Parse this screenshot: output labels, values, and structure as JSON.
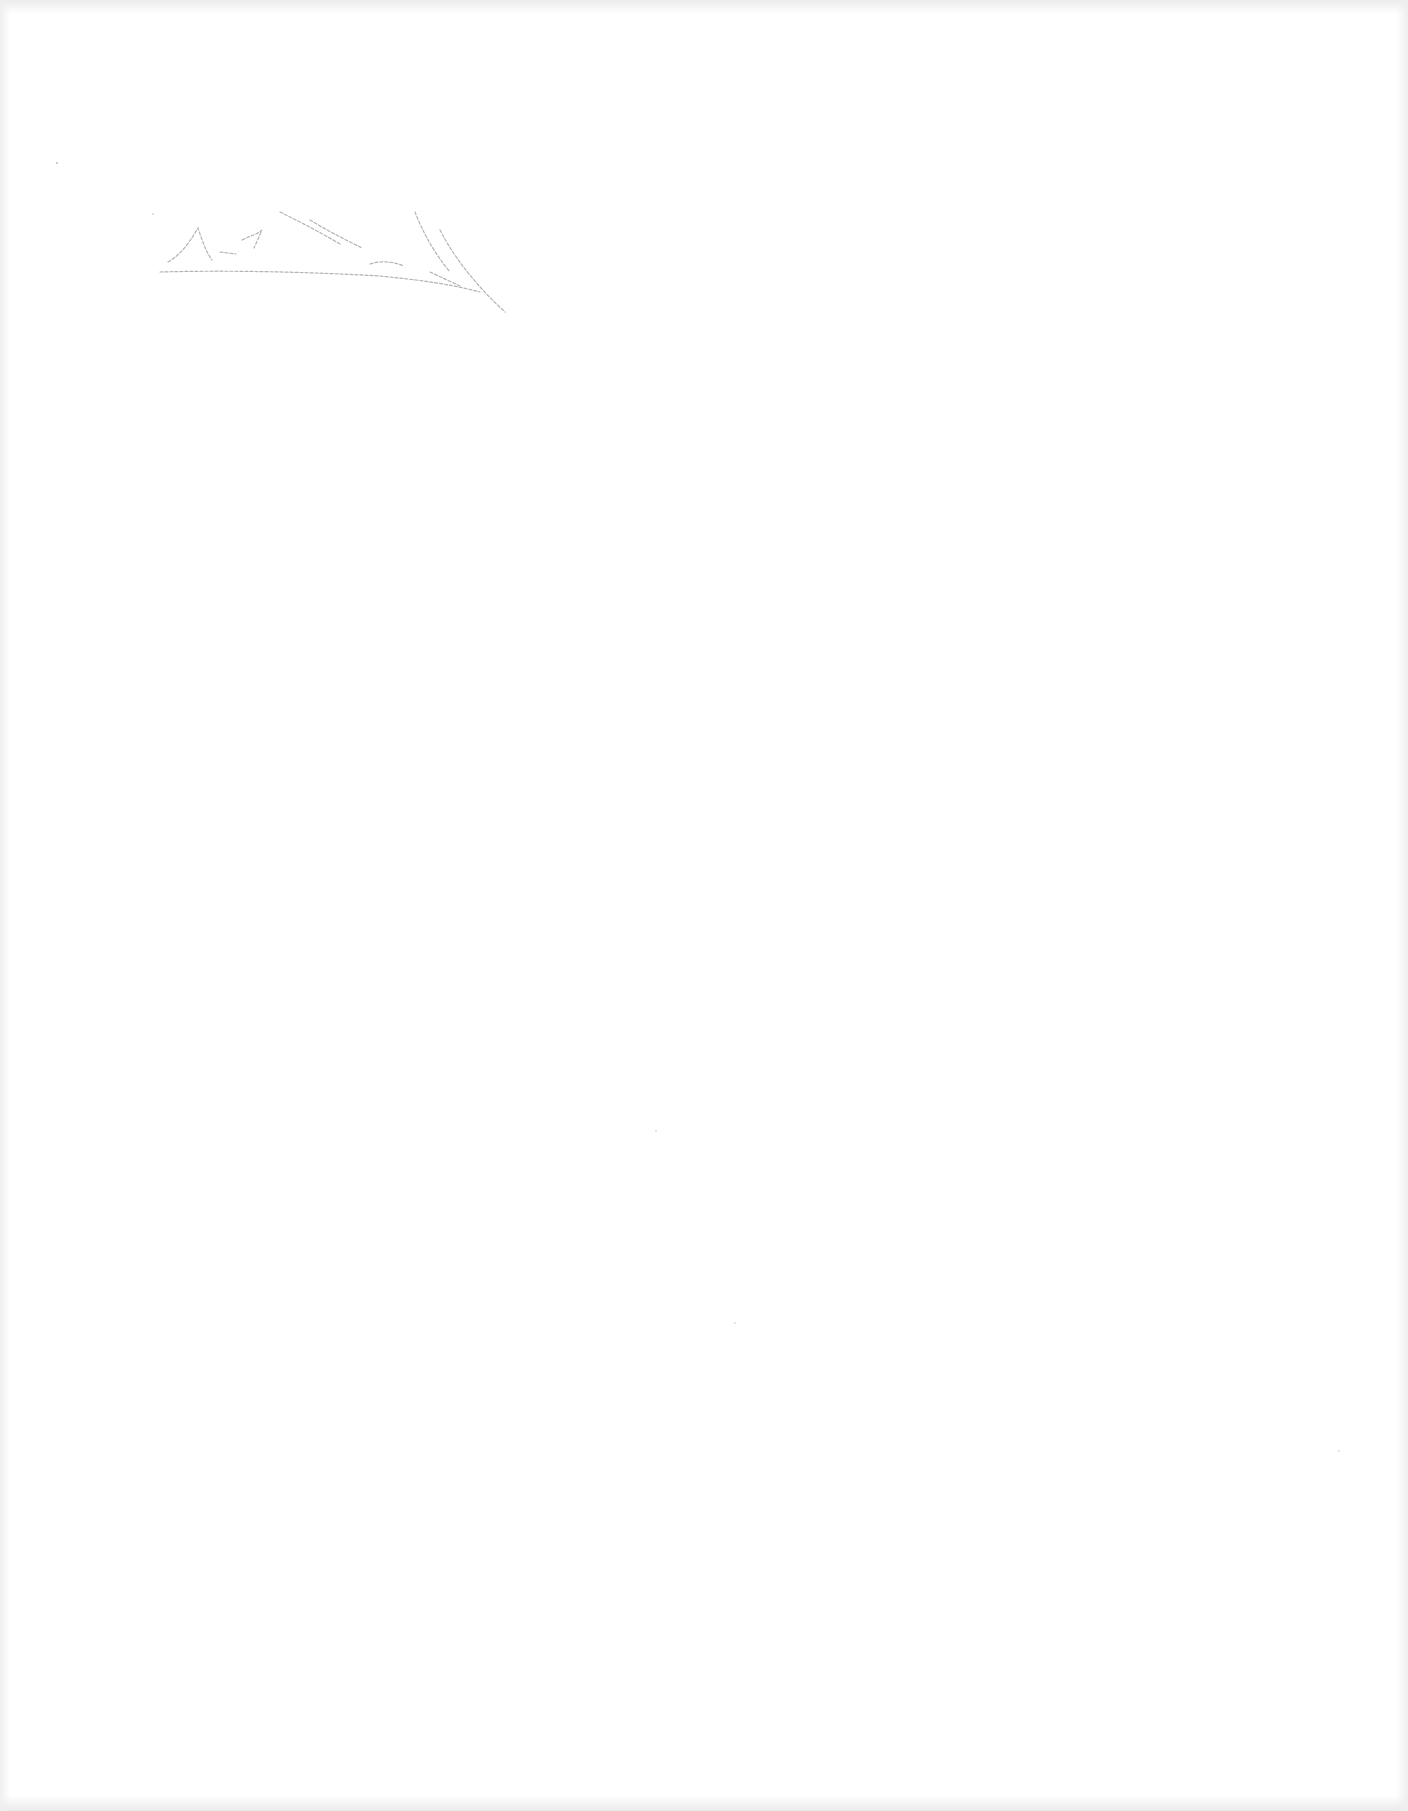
{
  "page": {
    "type": "blank scanned page",
    "background_color": "#ffffff",
    "text_content": []
  },
  "marks": [
    {
      "kind": "pencil-scribble",
      "description": "faint illegible pencil mark / signature",
      "color": "#9a9a9a",
      "bbox": {
        "x": 150,
        "y": 205,
        "width": 360,
        "height": 115
      }
    }
  ]
}
